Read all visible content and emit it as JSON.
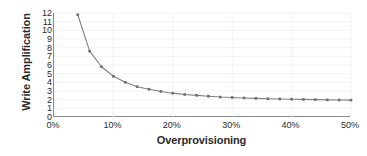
{
  "chart_data": {
    "type": "line",
    "title": "",
    "xlabel": "Overprovisioning",
    "ylabel": "Write Amplification",
    "xlim": [
      0,
      50
    ],
    "ylim": [
      0,
      12
    ],
    "grid": true,
    "legend": "none",
    "series_color": "#808080",
    "marker": "square",
    "x_tick_labels": [
      "0%",
      "10%",
      "20%",
      "30%",
      "40%",
      "50%"
    ],
    "x_ticks": [
      0,
      10,
      20,
      30,
      40,
      50
    ],
    "y_tick_labels": [
      "0",
      "1",
      "2",
      "3",
      "4",
      "5",
      "6",
      "7",
      "8",
      "9",
      "10",
      "11",
      "12"
    ],
    "y_ticks": [
      0,
      1,
      2,
      3,
      4,
      5,
      6,
      7,
      8,
      9,
      10,
      11,
      12
    ],
    "x": [
      4,
      6,
      8,
      10,
      12,
      14,
      16,
      18,
      20,
      22,
      24,
      26,
      28,
      30,
      32,
      34,
      36,
      38,
      40,
      42,
      44,
      46,
      48,
      50
    ],
    "values": [
      11.8,
      7.6,
      5.8,
      4.7,
      4.0,
      3.5,
      3.2,
      2.95,
      2.75,
      2.6,
      2.5,
      2.4,
      2.3,
      2.25,
      2.2,
      2.15,
      2.1,
      2.08,
      2.05,
      2.03,
      2.0,
      1.98,
      1.96,
      1.95
    ],
    "series": [
      {
        "name": "Write Amplification",
        "values": [
          11.8,
          7.6,
          5.8,
          4.7,
          4.0,
          3.5,
          3.2,
          2.95,
          2.75,
          2.6,
          2.5,
          2.4,
          2.3,
          2.25,
          2.2,
          2.15,
          2.1,
          2.08,
          2.05,
          2.03,
          2.0,
          1.98,
          1.96,
          1.95
        ]
      }
    ]
  },
  "colors": {
    "background": "#ffffff",
    "axis": "#8a8a8a",
    "grid": "#f0f0f0",
    "text": "#2b2b2b",
    "line": "#808080",
    "marker": "#6e6e6e"
  }
}
